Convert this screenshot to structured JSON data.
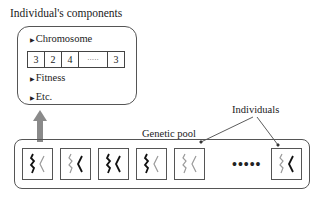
{
  "components_panel": {
    "title": "Individual's components",
    "chromosome_label": "Chromosome",
    "chromosome_genes": [
      "3",
      "2",
      "4",
      "·····",
      "3"
    ],
    "fitness_label": "Fitness",
    "etc_label": "Etc.",
    "bullet": "▶"
  },
  "pool": {
    "label": "Genetic pool",
    "individuals_label": "Individuals",
    "ellipsis": "•••••",
    "individuals": [
      {
        "left_strand": "dark",
        "right_strand": "light"
      },
      {
        "left_strand": "light",
        "right_strand": "dark"
      },
      {
        "left_strand": "dark",
        "right_strand": "dark"
      },
      {
        "left_strand": "dark",
        "right_strand": "light"
      },
      {
        "left_strand": "light",
        "right_strand": "light"
      },
      {
        "left_strand": "light",
        "right_strand": "dark"
      }
    ]
  },
  "colors": {
    "dark_strand": "#111111",
    "light_strand": "#9a9a9a",
    "arrow": "#8a8a8a",
    "border": "#555555"
  }
}
